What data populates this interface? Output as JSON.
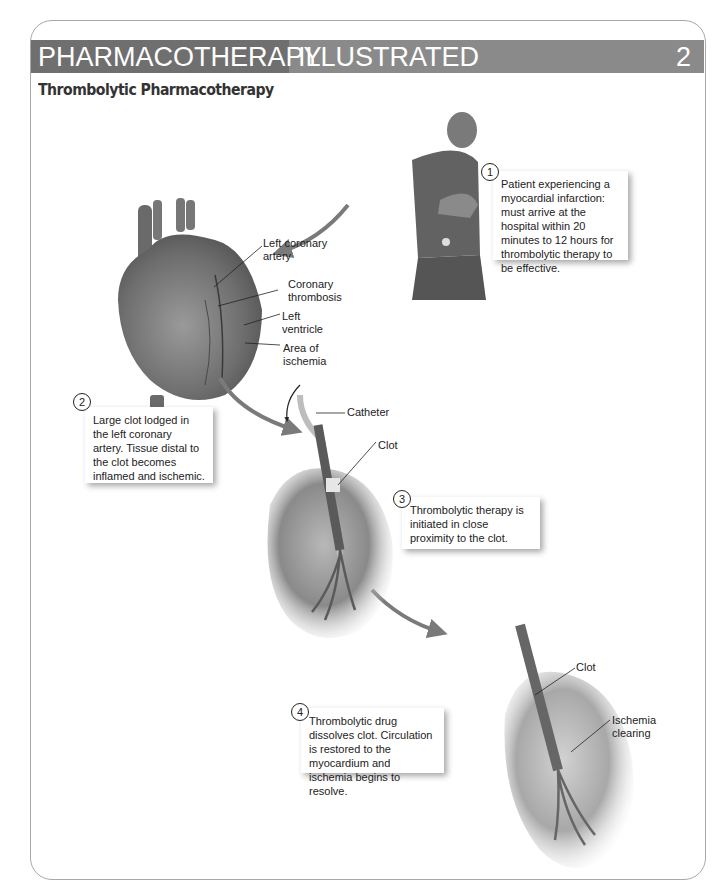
{
  "header": {
    "title_part1": "PHARMACOTHERAPY",
    "title_part2": "ILLUSTRATED",
    "chapter_number": "2",
    "subtitle": "Thrombolytic Pharmacotherapy"
  },
  "colors": {
    "banner_dark": "#6f6f6f",
    "banner_light": "#8a8a8a",
    "arrow": "#7a7a7a"
  },
  "steps": [
    {
      "number": "1",
      "text": "Patient experiencing a myocardial infarction: must arrive at the hospital within 20 minutes to 12 hours for thrombolytic therapy to be effective."
    },
    {
      "number": "2",
      "text": "Large clot lodged in the left coronary artery. Tissue distal to the clot becomes inflamed and ischemic."
    },
    {
      "number": "3",
      "text": "Thrombolytic therapy is initiated in close proximity to the clot."
    },
    {
      "number": "4",
      "text": "Thrombolytic drug dissolves clot. Circulation is restored to the myocardium and ischemia begins to resolve."
    }
  ],
  "heart_labels": {
    "left_coronary_artery": "Left coronary artery",
    "coronary_thrombosis": "Coronary thrombosis",
    "left_ventricle": "Left ventricle",
    "area_of_ischemia": "Area of ischemia"
  },
  "catheter_labels": {
    "catheter": "Catheter",
    "clot": "Clot"
  },
  "resolved_labels": {
    "clot": "Clot",
    "ischemia_clearing": "Ischemia clearing"
  }
}
